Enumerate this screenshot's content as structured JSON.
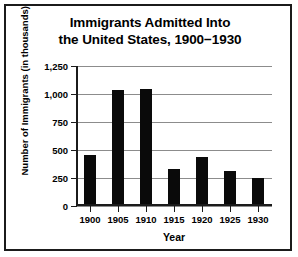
{
  "chart_data": {
    "type": "bar",
    "title": "Immigrants Admitted Into the United States, 1900−1930",
    "title_lines": [
      "Immigrants Admitted Into",
      "the United States, 1900−1930"
    ],
    "xlabel": "Year",
    "ylabel": "Number of Immigrants (in thousands)",
    "categories": [
      "1900",
      "1905",
      "1910",
      "1915",
      "1920",
      "1925",
      "1930"
    ],
    "values": [
      450,
      1025,
      1040,
      325,
      430,
      300,
      240
    ],
    "ylim": [
      0,
      1250
    ],
    "yticks": [
      0,
      250,
      500,
      750,
      1000,
      1250
    ],
    "ytick_labels": [
      "0",
      "250",
      "500",
      "750",
      "1,000",
      "1,250"
    ],
    "grid": "horizontal",
    "legend": "none",
    "bar_color": "#0a0a0a",
    "grid_color": "#8c8c8c",
    "axis_color": "#1b1b1b",
    "background_color": "#ffffff"
  }
}
